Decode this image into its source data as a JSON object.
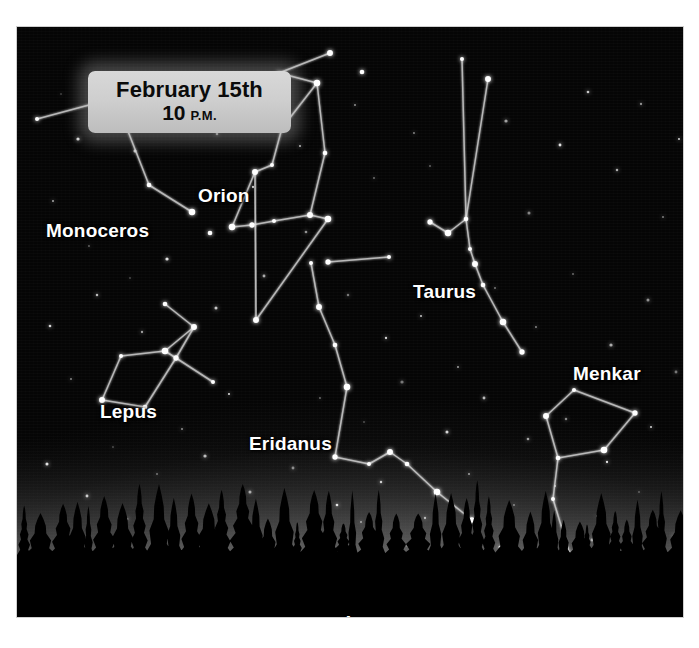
{
  "chart_data": {
    "type": "scatter",
    "xlabel": "",
    "ylabel": "",
    "grid": false,
    "legend": "none",
    "view": {
      "facing_direction": "Southwest",
      "date": "February 15th",
      "time": "10 P.M.",
      "horizon": "conifer treeline silhouette"
    },
    "constellations": [
      {
        "name": "Monoceros",
        "label_x": 29,
        "label_y": 193,
        "stars": [
          [
            20,
            92
          ],
          [
            98,
            71
          ],
          [
            132,
            158
          ],
          [
            175,
            185
          ]
        ],
        "lines": [
          [
            0,
            1
          ],
          [
            1,
            2
          ],
          [
            2,
            3
          ]
        ]
      },
      {
        "name": "Orion",
        "label_x": 181,
        "label_y": 158,
        "stars": [
          [
            262,
            46
          ],
          [
            313,
            26
          ],
          [
            345,
            45
          ],
          [
            300,
            56
          ],
          [
            265,
            101
          ],
          [
            255,
            138
          ],
          [
            238,
            145
          ],
          [
            193,
            206
          ],
          [
            215,
            200
          ],
          [
            235,
            198
          ],
          [
            257,
            194
          ],
          [
            293,
            188
          ],
          [
            308,
            126
          ],
          [
            311,
            192
          ],
          [
            311,
            235
          ],
          [
            372,
            230
          ],
          [
            239,
            293
          ]
        ],
        "lines": [
          [
            1,
            0
          ],
          [
            0,
            3
          ],
          [
            3,
            4
          ],
          [
            4,
            5
          ],
          [
            5,
            6
          ],
          [
            6,
            8
          ],
          [
            8,
            9
          ],
          [
            9,
            10
          ],
          [
            10,
            11
          ],
          [
            11,
            12
          ],
          [
            12,
            3
          ],
          [
            11,
            13
          ],
          [
            13,
            14
          ],
          [
            14,
            15
          ],
          [
            13,
            16
          ],
          [
            16,
            6
          ]
        ]
      },
      {
        "name": "Taurus",
        "label_x": 396,
        "label_y": 254,
        "stars": [
          [
            445,
            32
          ],
          [
            471,
            52
          ],
          [
            449,
            192
          ],
          [
            431,
            206
          ],
          [
            413,
            195
          ],
          [
            453,
            222
          ],
          [
            458,
            237
          ],
          [
            466,
            258
          ],
          [
            486,
            295
          ],
          [
            505,
            325
          ]
        ],
        "lines": [
          [
            0,
            2
          ],
          [
            1,
            2
          ],
          [
            2,
            3
          ],
          [
            3,
            4
          ],
          [
            2,
            5
          ],
          [
            5,
            6
          ],
          [
            6,
            7
          ],
          [
            7,
            8
          ],
          [
            8,
            9
          ]
        ]
      },
      {
        "name": "Lepus",
        "label_x": 83,
        "label_y": 374,
        "stars": [
          [
            104,
            329
          ],
          [
            85,
            373
          ],
          [
            128,
            380
          ],
          [
            148,
            324
          ],
          [
            159,
            331
          ],
          [
            196,
            355
          ],
          [
            177,
            300
          ],
          [
            148,
            277
          ]
        ],
        "lines": [
          [
            0,
            1
          ],
          [
            1,
            2
          ],
          [
            2,
            4
          ],
          [
            4,
            3
          ],
          [
            3,
            0
          ],
          [
            4,
            5
          ],
          [
            4,
            6
          ],
          [
            6,
            7
          ],
          [
            6,
            3
          ]
        ]
      },
      {
        "name": "Eridanus",
        "label_x": 232,
        "label_y": 406,
        "stars": [
          [
            294,
            236
          ],
          [
            302,
            280
          ],
          [
            318,
            318
          ],
          [
            330,
            360
          ],
          [
            318,
            430
          ],
          [
            352,
            437
          ],
          [
            373,
            425
          ],
          [
            390,
            437
          ],
          [
            420,
            465
          ],
          [
            455,
            493
          ],
          [
            443,
            525
          ],
          [
            470,
            547
          ]
        ],
        "lines": [
          [
            0,
            1
          ],
          [
            1,
            2
          ],
          [
            2,
            3
          ],
          [
            3,
            4
          ],
          [
            4,
            5
          ],
          [
            5,
            6
          ],
          [
            6,
            7
          ],
          [
            7,
            8
          ],
          [
            8,
            9
          ],
          [
            9,
            10
          ],
          [
            10,
            11
          ]
        ]
      },
      {
        "name": "Menkar",
        "label_x": 556,
        "label_y": 336,
        "stars": [
          [
            557,
            363
          ],
          [
            529,
            389
          ],
          [
            541,
            431
          ],
          [
            587,
            423
          ],
          [
            618,
            386
          ],
          [
            536,
            472
          ],
          [
            553,
            528
          ]
        ],
        "lines": [
          [
            0,
            1
          ],
          [
            1,
            2
          ],
          [
            2,
            3
          ],
          [
            3,
            4
          ],
          [
            4,
            0
          ],
          [
            2,
            5
          ],
          [
            5,
            6
          ]
        ]
      }
    ],
    "field_stars": [
      [
        44,
        67
      ],
      [
        61,
        112
      ],
      [
        118,
        124
      ],
      [
        156,
        62
      ],
      [
        200,
        107
      ],
      [
        243,
        84
      ],
      [
        236,
        160
      ],
      [
        283,
        119
      ],
      [
        338,
        78
      ],
      [
        357,
        151
      ],
      [
        397,
        106
      ],
      [
        413,
        139
      ],
      [
        489,
        94
      ],
      [
        512,
        186
      ],
      [
        543,
        118
      ],
      [
        571,
        65
      ],
      [
        600,
        143
      ],
      [
        624,
        77
      ],
      [
        646,
        190
      ],
      [
        662,
        112
      ],
      [
        36,
        174
      ],
      [
        72,
        219
      ],
      [
        113,
        251
      ],
      [
        150,
        232
      ],
      [
        199,
        281
      ],
      [
        247,
        249
      ],
      [
        289,
        205
      ],
      [
        331,
        268
      ],
      [
        369,
        311
      ],
      [
        404,
        289
      ],
      [
        441,
        340
      ],
      [
        478,
        261
      ],
      [
        519,
        300
      ],
      [
        556,
        247
      ],
      [
        594,
        318
      ],
      [
        631,
        273
      ],
      [
        659,
        345
      ],
      [
        33,
        299
      ],
      [
        80,
        268
      ],
      [
        125,
        305
      ],
      [
        165,
        402
      ],
      [
        212,
        367
      ],
      [
        259,
        419
      ],
      [
        303,
        371
      ],
      [
        347,
        395
      ],
      [
        385,
        355
      ],
      [
        430,
        405
      ],
      [
        467,
        371
      ],
      [
        511,
        412
      ],
      [
        549,
        392
      ],
      [
        590,
        435
      ],
      [
        634,
        400
      ],
      [
        668,
        430
      ],
      [
        54,
        352
      ],
      [
        96,
        420
      ],
      [
        140,
        447
      ],
      [
        188,
        429
      ],
      [
        233,
        465
      ],
      [
        276,
        441
      ],
      [
        320,
        478
      ],
      [
        364,
        455
      ],
      [
        408,
        491
      ],
      [
        452,
        447
      ],
      [
        497,
        478
      ],
      [
        538,
        459
      ],
      [
        580,
        489
      ],
      [
        622,
        465
      ],
      [
        664,
        495
      ],
      [
        30,
        437
      ],
      [
        70,
        469
      ],
      [
        110,
        492
      ],
      [
        158,
        509
      ],
      [
        205,
        487
      ],
      [
        251,
        507
      ],
      [
        298,
        524
      ],
      [
        344,
        495
      ],
      [
        390,
        519
      ],
      [
        436,
        503
      ],
      [
        483,
        520
      ],
      [
        528,
        497
      ],
      [
        575,
        513
      ],
      [
        617,
        528
      ],
      [
        657,
        509
      ]
    ]
  },
  "date_box": {
    "date": "February 15th",
    "hour": "10",
    "ampm": "P.M."
  },
  "labels": {
    "monoceros": "Monoceros",
    "orion": "Orion",
    "taurus": "Taurus",
    "menkar": "Menkar",
    "lepus": "Lepus",
    "eridanus": "Eridanus",
    "southwest": "Southwest"
  },
  "colors": {
    "sky_top": "#050505",
    "sky_horizon_glow": "#5d5d5d",
    "star": "#ffffff",
    "constellation_line": "#d8d8d8",
    "label_text": "#ffffff",
    "date_box_bg": "#cfcfcf",
    "date_box_text": "#0b0b0b",
    "treeline": "#000000"
  }
}
